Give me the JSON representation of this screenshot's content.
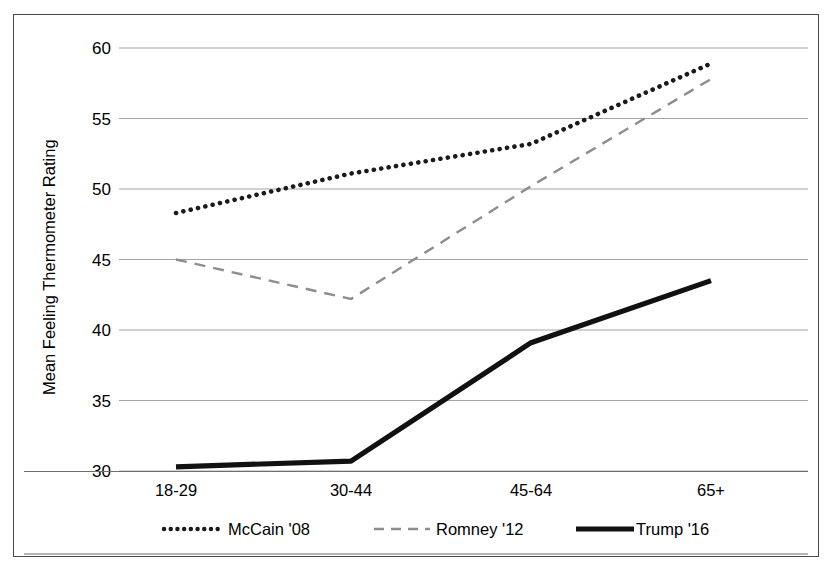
{
  "chart_data": {
    "type": "line",
    "title": "",
    "subtitle": "",
    "xlabel": "",
    "ylabel": "Mean Feeling Thermometer Rating",
    "categories": [
      "18-29",
      "30-44",
      "45-64",
      "65+"
    ],
    "ylim": [
      30,
      60
    ],
    "yticks": [
      30,
      35,
      40,
      45,
      50,
      55,
      60
    ],
    "ytick_labels": [
      "30",
      "35",
      "40",
      "45",
      "50",
      "55",
      "60"
    ],
    "grid": true,
    "grid_axis": "y",
    "legend_position": "bottom",
    "series": [
      {
        "name": "McCain '08",
        "style": "dotted",
        "color": "#1a1a1a",
        "values": [
          48.3,
          51.1,
          53.2,
          58.9
        ]
      },
      {
        "name": "Romney '12",
        "style": "dashed",
        "color": "#8d8d8d",
        "values": [
          45.0,
          42.2,
          50.2,
          57.8
        ]
      },
      {
        "name": "Trump '16",
        "style": "solid",
        "color": "#111111",
        "values": [
          30.3,
          30.7,
          39.1,
          43.5
        ]
      }
    ]
  },
  "axis": {
    "y_title": "Mean Feeling Thermometer Rating",
    "y_labels": [
      "60",
      "55",
      "50",
      "45",
      "40",
      "35",
      "30"
    ],
    "x_labels": [
      "18-29",
      "30-44",
      "45-64",
      "65+"
    ]
  },
  "legend": {
    "items": [
      {
        "label": "McCain '08",
        "marker": "dotted-line-swatch"
      },
      {
        "label": "Romney '12",
        "marker": "dashed-line-swatch"
      },
      {
        "label": "Trump '16",
        "marker": "solid-line-swatch"
      }
    ]
  },
  "colors": {
    "mccain": "#1a1a1a",
    "romney": "#8d8d8d",
    "trump": "#111111",
    "grid": "#9a9a9a",
    "border": "#4a4a4a"
  }
}
